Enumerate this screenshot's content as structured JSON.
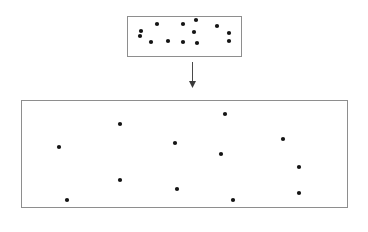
{
  "figure": {
    "type": "diagram",
    "background_color": "#ffffff",
    "width": 368,
    "height": 232
  },
  "style": {
    "box_stroke_color": "#8e8e8e",
    "box_fill_color": "#ffffff",
    "box_stroke_width": 1,
    "particle_color": "#141414",
    "particle_radius": 2.1,
    "arrow_color": "#4a4a4a"
  },
  "source_container": {
    "label": "small-box",
    "x": 127,
    "y": 16,
    "width": 114,
    "height": 40,
    "particle_count": 13,
    "particles": [
      {
        "cx": 157,
        "cy": 24
      },
      {
        "cx": 183,
        "cy": 24
      },
      {
        "cx": 196,
        "cy": 20
      },
      {
        "cx": 141,
        "cy": 31
      },
      {
        "cx": 217,
        "cy": 26
      },
      {
        "cx": 194,
        "cy": 32
      },
      {
        "cx": 229,
        "cy": 33
      },
      {
        "cx": 140,
        "cy": 36
      },
      {
        "cx": 151,
        "cy": 42
      },
      {
        "cx": 168,
        "cy": 41
      },
      {
        "cx": 183,
        "cy": 42
      },
      {
        "cx": 197,
        "cy": 43
      },
      {
        "cx": 229,
        "cy": 41
      }
    ]
  },
  "transition_arrow": {
    "label": "downward-arrow",
    "x": 192,
    "y_start": 62,
    "y_end": 88,
    "head_width": 7,
    "head_length": 7,
    "direction": "down"
  },
  "target_container": {
    "label": "large-box",
    "x": 21,
    "y": 100,
    "width": 326,
    "height": 107,
    "particle_count": 12,
    "particles": [
      {
        "cx": 225,
        "cy": 114
      },
      {
        "cx": 120,
        "cy": 124
      },
      {
        "cx": 283,
        "cy": 139
      },
      {
        "cx": 175,
        "cy": 143
      },
      {
        "cx": 59,
        "cy": 147
      },
      {
        "cx": 221,
        "cy": 154
      },
      {
        "cx": 299,
        "cy": 167
      },
      {
        "cx": 120,
        "cy": 180
      },
      {
        "cx": 177,
        "cy": 189
      },
      {
        "cx": 299,
        "cy": 193
      },
      {
        "cx": 233,
        "cy": 200
      },
      {
        "cx": 67,
        "cy": 200
      }
    ]
  }
}
